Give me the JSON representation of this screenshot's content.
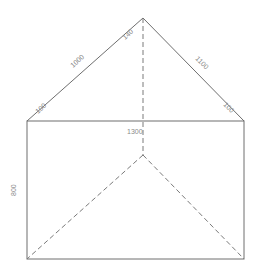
{
  "diagram": {
    "type": "roof-hip-elevation",
    "colors": {
      "line": "#6e6e6e",
      "dashed": "#7a7a7a",
      "label": "#8a8a8a",
      "background": "#ffffff"
    },
    "labels": {
      "left_slope": "1000",
      "right_slope": "1100",
      "apex_angle": "140",
      "left_corner": "100",
      "right_corner": "100",
      "width": "1300",
      "height": "800"
    }
  }
}
